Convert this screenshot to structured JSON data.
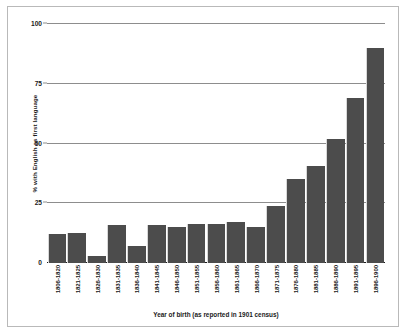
{
  "chart_data": {
    "type": "bar",
    "title": "",
    "xlabel": "Year of birth (as reported in 1901 census)",
    "ylabel": "% with English as first language",
    "ylim": [
      0,
      100
    ],
    "yticks": [
      0,
      25,
      50,
      75,
      100
    ],
    "ytick_labels": [
      "0",
      "25",
      "50",
      "75",
      "100"
    ],
    "grid": true,
    "legend": "none",
    "bar_color": "#4c4c4c",
    "gridline_color": "#8d8d8d",
    "axis_color": "#1a1a1a",
    "categories": [
      "1806-1820",
      "1821-1825",
      "1826-1830",
      "1831-1835",
      "1836-1840",
      "1841-1845",
      "1846-1850",
      "1851-1855",
      "1856-1860",
      "1861-1865",
      "1866-1870",
      "1871-1875",
      "1876-1880",
      "1881-1885",
      "1886-1890",
      "1891-1895",
      "1896-1900"
    ],
    "values": [
      12,
      12.5,
      3,
      16,
      7,
      16,
      15,
      16.5,
      16.5,
      17,
      15,
      24,
      35,
      40.5,
      52,
      69,
      90
    ]
  }
}
